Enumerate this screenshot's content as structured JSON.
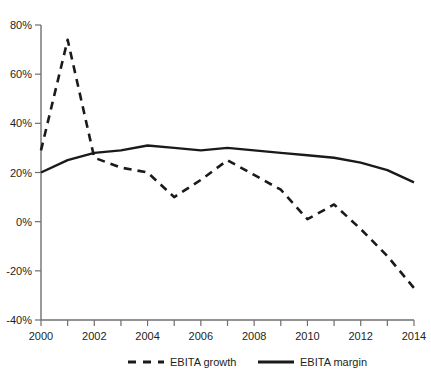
{
  "chart_data": {
    "type": "line",
    "title": "",
    "subtitle": "",
    "xlabel": "",
    "ylabel": "",
    "x": [
      2000,
      2001,
      2002,
      2003,
      2004,
      2005,
      2006,
      2007,
      2008,
      2009,
      2010,
      2011,
      2012,
      2013,
      2014
    ],
    "categories": [
      "2000",
      "2001",
      "2002",
      "2003",
      "2004",
      "2005",
      "2006",
      "2007",
      "2008",
      "2009",
      "2010",
      "2011",
      "2012",
      "2013",
      "2014"
    ],
    "xlim": [
      2000,
      2014
    ],
    "ylim": [
      -40,
      80
    ],
    "grid": false,
    "legend_position": "bottom",
    "xtick_labels": [
      "2000",
      "2002",
      "2004",
      "2006",
      "2008",
      "2010",
      "2012",
      "2014"
    ],
    "xtick_values": [
      2000,
      2002,
      2004,
      2006,
      2008,
      2010,
      2012,
      2014
    ],
    "ytick_labels": [
      "80%",
      "60%",
      "40%",
      "20%",
      "0%",
      "-20%",
      "-40%"
    ],
    "ytick_values": [
      80,
      60,
      40,
      20,
      0,
      -20,
      -40
    ],
    "series": [
      {
        "name": "EBITA growth",
        "style": "dashed",
        "color": "#1a1a1a",
        "values": [
          29,
          74,
          26,
          22,
          20,
          10,
          17,
          25,
          19,
          13,
          1,
          7,
          -3,
          -14,
          -27
        ]
      },
      {
        "name": "EBITA margin",
        "style": "solid",
        "color": "#1a1a1a",
        "values": [
          20,
          25,
          28,
          29,
          31,
          30,
          29,
          30,
          29,
          28,
          27,
          26,
          24,
          21,
          16
        ]
      }
    ]
  },
  "legend": {
    "items": [
      {
        "label": "EBITA growth",
        "style": "dashed"
      },
      {
        "label": "EBITA margin",
        "style": "solid"
      }
    ]
  },
  "axis": {
    "y_suffix": "%",
    "axis_color": "#6f6f6f"
  }
}
